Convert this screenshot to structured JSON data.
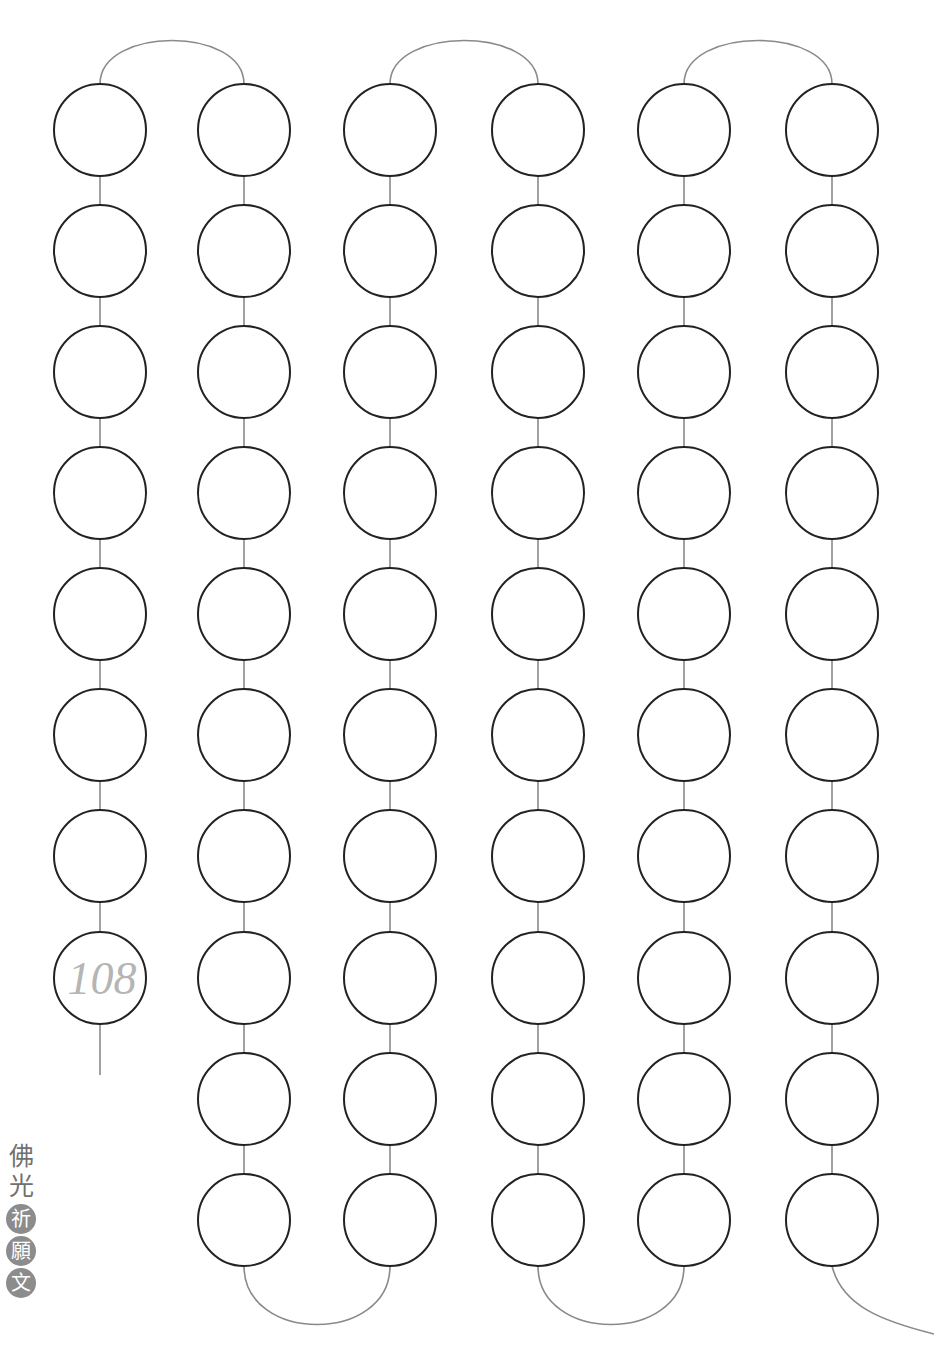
{
  "page": {
    "title_chars_plain": [
      "佛",
      "光"
    ],
    "title_chars_badge": [
      "祈",
      "願",
      "文"
    ]
  },
  "chart": {
    "bead_radius": 46,
    "columns_x": [
      100,
      244,
      390,
      538,
      684,
      832
    ],
    "rows_y": [
      130,
      251,
      372,
      493,
      614,
      735,
      856,
      978,
      1099,
      1220
    ],
    "column_rows": [
      8,
      10,
      10,
      10,
      10,
      10
    ],
    "start_label": "108",
    "start_column": 0,
    "start_row": 7,
    "total_beads": 58,
    "colors": {
      "bead_stroke": "#222222",
      "string": "#8a8a8a",
      "label": "#b5b5b5",
      "badge": "#8c8c8c"
    }
  }
}
